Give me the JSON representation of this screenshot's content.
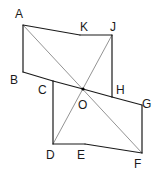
{
  "diagram": {
    "vertices": [
      {
        "name": "A",
        "label": "A",
        "x": 23,
        "y": 25,
        "lx": 15,
        "ly": 18
      },
      {
        "name": "K",
        "label": "K",
        "x": 80,
        "y": 35,
        "lx": 80,
        "ly": 31
      },
      {
        "name": "J",
        "label": "J",
        "x": 112,
        "y": 35,
        "lx": 110,
        "ly": 31
      },
      {
        "name": "B",
        "label": "B",
        "x": 23,
        "y": 72,
        "lx": 10,
        "ly": 84
      },
      {
        "name": "C",
        "label": "C",
        "x": 53,
        "y": 81,
        "lx": 38,
        "ly": 94
      },
      {
        "name": "O",
        "label": "O",
        "x": 83,
        "y": 89,
        "lx": 78,
        "ly": 109
      },
      {
        "name": "H",
        "label": "H",
        "x": 112,
        "y": 97,
        "lx": 116,
        "ly": 94
      },
      {
        "name": "G",
        "label": "G",
        "x": 142,
        "y": 105,
        "lx": 142,
        "ly": 108
      },
      {
        "name": "D",
        "label": "D",
        "x": 53,
        "y": 144,
        "lx": 46,
        "ly": 159
      },
      {
        "name": "E",
        "label": "E",
        "x": 85,
        "y": 144,
        "lx": 77,
        "ly": 159
      },
      {
        "name": "F",
        "label": "F",
        "x": 142,
        "y": 153,
        "lx": 134,
        "ly": 168
      }
    ],
    "edges": [
      [
        "A",
        "K"
      ],
      [
        "K",
        "J"
      ],
      [
        "J",
        "H"
      ],
      [
        "H",
        "G"
      ],
      [
        "G",
        "F"
      ],
      [
        "F",
        "E"
      ],
      [
        "E",
        "D"
      ],
      [
        "D",
        "C"
      ],
      [
        "C",
        "B"
      ],
      [
        "B",
        "A"
      ],
      [
        "C",
        "O"
      ],
      [
        "O",
        "H"
      ]
    ],
    "diagonals": [
      [
        "A",
        "F"
      ],
      [
        "J",
        "D"
      ]
    ],
    "center_point": "O"
  }
}
